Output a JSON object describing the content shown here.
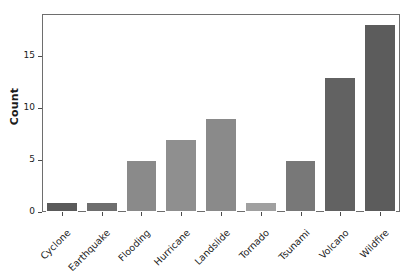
{
  "chart_data": {
    "type": "bar",
    "title": "",
    "xlabel": "",
    "ylabel": "Count",
    "categories": [
      "Cyclone",
      "Earthquake",
      "Flooding",
      "Hurricane",
      "Landslide",
      "Tornado",
      "Tsunami",
      "Volcano",
      "Wildfire"
    ],
    "values": [
      1,
      1,
      5,
      7,
      9,
      1,
      5,
      13,
      18
    ],
    "bar_colors": [
      "#5a5a5a",
      "#6e6e6e",
      "#8a8a8a",
      "#8f8f8f",
      "#8a8a8a",
      "#a0a0a0",
      "#787878",
      "#626262",
      "#5c5c5c"
    ],
    "yticks": [
      0,
      5,
      10,
      15
    ],
    "ytick_labels": [
      "0",
      "5",
      "10",
      "15"
    ],
    "ylim": [
      0,
      19
    ],
    "grid": false,
    "legend": "none",
    "frame_color": "#6e6e6e",
    "background": "#ffffff",
    "text_color": "#1a1a1a"
  }
}
